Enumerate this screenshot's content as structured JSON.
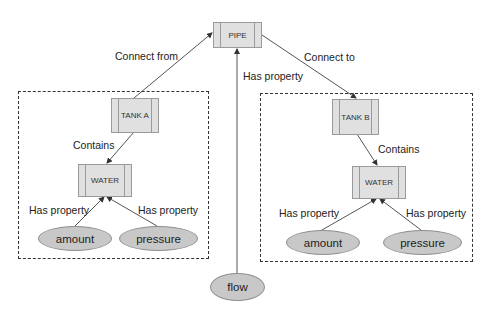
{
  "diagram": {
    "nodes": {
      "pipe": "PIPE",
      "tank_a": "TANK A",
      "tank_b": "TANK B",
      "water_a": "WATER",
      "water_b": "WATER"
    },
    "properties": {
      "amount_a": "amount",
      "pressure_a": "pressure",
      "amount_b": "amount",
      "pressure_b": "pressure",
      "flow": "flow"
    },
    "edges": {
      "connect_from": "Connect from",
      "connect_to": "Connect to",
      "pipe_has_property": "Has property",
      "contains_a": "Contains",
      "contains_b": "Contains",
      "has_property_amount_a": "Has property",
      "has_property_pressure_a": "Has property",
      "has_property_amount_b": "Has property",
      "has_property_pressure_b": "Has property"
    }
  }
}
